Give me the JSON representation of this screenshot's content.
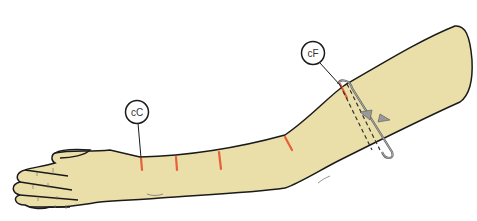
{
  "diagram": {
    "skin_color": "#eadfa8",
    "outline_color": "#1a1a1a",
    "marker_color": "#e8603a",
    "tape_color": "#8a8a8a",
    "labels": [
      {
        "id": "cC",
        "text": "cC",
        "description": "wrist circumference point"
      },
      {
        "id": "cF",
        "text": "cF",
        "description": "upper arm circumference point"
      }
    ],
    "markers_count": 4
  }
}
